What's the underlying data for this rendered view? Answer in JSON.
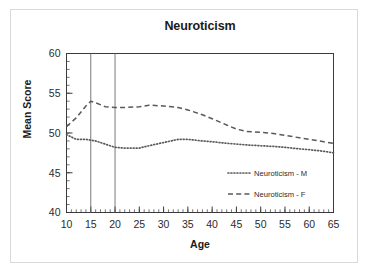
{
  "figure": {
    "title": "Neuroticism",
    "xlabel": "Age",
    "ylabel": "Mean Score"
  },
  "legend": {
    "items": [
      {
        "label": "Neuroticism - M",
        "style": "dotted"
      },
      {
        "label": "Neuroticism - F",
        "style": "dashed"
      }
    ]
  },
  "axis_labels": {
    "y": [
      "60",
      "55",
      "50",
      "45",
      "40"
    ],
    "x": [
      "10",
      "15",
      "20",
      "25",
      "30",
      "35",
      "40",
      "45",
      "50",
      "55",
      "60",
      "65"
    ]
  },
  "colors": {
    "line": "#595959",
    "axis": "#3b3b3b",
    "reference_line": "#6b6b6b",
    "background": "#ffffff",
    "card_border": "#d9d9d9"
  },
  "chart_data": {
    "type": "line",
    "title": "Neuroticism",
    "xlabel": "Age",
    "ylabel": "Mean Score",
    "xlim": [
      10,
      65
    ],
    "ylim": [
      40,
      60
    ],
    "xticks": [
      10,
      15,
      20,
      25,
      30,
      35,
      40,
      45,
      50,
      55,
      60,
      65
    ],
    "yticks": [
      40,
      45,
      50,
      55,
      60
    ],
    "x_minor_tick_step": 1,
    "y_minor_tick_step": 1,
    "grid": false,
    "legend_position": "lower-right-inside",
    "reference_lines": [
      {
        "orientation": "vertical",
        "x": 15
      },
      {
        "orientation": "vertical",
        "x": 20
      }
    ],
    "x": [
      10,
      12,
      14,
      15,
      16,
      18,
      20,
      22,
      25,
      27,
      30,
      33,
      35,
      38,
      40,
      43,
      45,
      47,
      50,
      53,
      55,
      58,
      60,
      63,
      65
    ],
    "series": [
      {
        "name": "Neuroticism - M",
        "style": "dotted",
        "values": [
          49.8,
          49.2,
          49.2,
          49.1,
          49.0,
          48.6,
          48.2,
          48.1,
          48.1,
          48.4,
          48.8,
          49.2,
          49.2,
          49.0,
          48.9,
          48.7,
          48.6,
          48.5,
          48.4,
          48.3,
          48.2,
          48.0,
          47.9,
          47.7,
          47.5
        ]
      },
      {
        "name": "Neuroticism - F",
        "style": "dashed",
        "values": [
          50.8,
          51.9,
          53.4,
          54.0,
          53.8,
          53.3,
          53.2,
          53.2,
          53.3,
          53.5,
          53.4,
          53.2,
          52.9,
          52.3,
          51.8,
          51.0,
          50.5,
          50.2,
          50.1,
          49.9,
          49.7,
          49.4,
          49.2,
          48.9,
          48.7
        ]
      }
    ]
  }
}
